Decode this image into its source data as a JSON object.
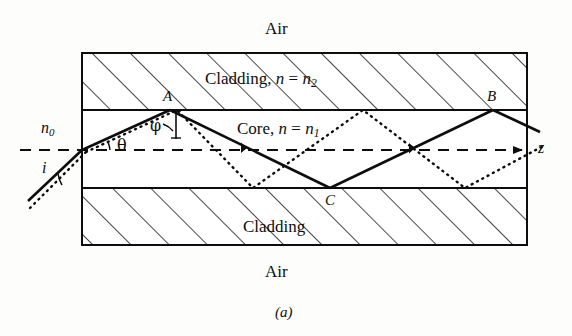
{
  "figure": {
    "caption": "(a)",
    "type": "optical-fiber-ray-diagram",
    "title_top_medium": "Air",
    "title_bottom_medium": "Air"
  },
  "layers": {
    "top_air_label": "Air",
    "top_cladding_label": "Cladding, ",
    "top_cladding_index_n": "n",
    "top_cladding_index_eq": " = ",
    "top_cladding_index_value": "n",
    "top_cladding_index_sub": "2",
    "core_label": "Core, ",
    "core_index_n": "n",
    "core_index_eq": " = ",
    "core_index_value": "n",
    "core_index_sub": "1",
    "bottom_cladding_label": "Cladding",
    "bottom_air_label": "Air"
  },
  "annotations": {
    "external_index": "n",
    "external_index_sub": "0",
    "incidence_angle": "i",
    "refraction_angle": "θ",
    "internal_angle": "φ",
    "point_a": "A",
    "point_b": "B",
    "point_c": "C",
    "axis_label": "z"
  },
  "colors": {
    "ink": "#0d0d0d",
    "background": "#fdfdfc",
    "hatch": "#1a1a1a"
  },
  "geometry": {
    "slab_left_x": 82,
    "slab_right_x": 527,
    "top_outer_y": 53,
    "top_interface_y": 110,
    "bottom_interface_y": 188,
    "bottom_outer_y": 245,
    "axis_y": 150,
    "entry_point_x": 82,
    "entry_point_y": 150,
    "point_a_x": 170,
    "point_a_y": 110,
    "point_c_x": 330,
    "point_c_y": 188,
    "point_b_x": 493,
    "point_b_y": 110,
    "dotted_bounce_bottom_1_x": 253,
    "dotted_bounce_top_x": 363,
    "dotted_bounce_bottom_2_x": 465
  }
}
